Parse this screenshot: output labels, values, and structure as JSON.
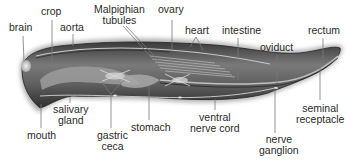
{
  "diagram": {
    "labels": {
      "brain": "brain",
      "crop": "crop",
      "aorta": "aorta",
      "malpighian_line1": "Malpighian",
      "malpighian_line2": "tubules",
      "ovary": "ovary",
      "heart": "heart",
      "intestine": "intestine",
      "oviduct": "oviduct",
      "rectum": "rectum",
      "mouth": "mouth",
      "salivary_line1": "salivary",
      "salivary_line2": "gland",
      "gastric_line1": "gastric",
      "gastric_line2": "ceca",
      "stomach": "stomach",
      "ventral_line1": "ventral",
      "ventral_line2": "nerve cord",
      "nerve_line1": "nerve",
      "nerve_line2": "ganglion",
      "seminal_line1": "seminal",
      "seminal_line2": "receptacle"
    },
    "colors": {
      "background": "#ffffff",
      "label_text": "#2a2a2a",
      "leader_line": "#7a7a7a",
      "body_dark": "#2b2b2b",
      "body_mid": "#6e6e6e",
      "body_light": "#b5b5b5",
      "organ_light": "#d8d8d8"
    }
  }
}
